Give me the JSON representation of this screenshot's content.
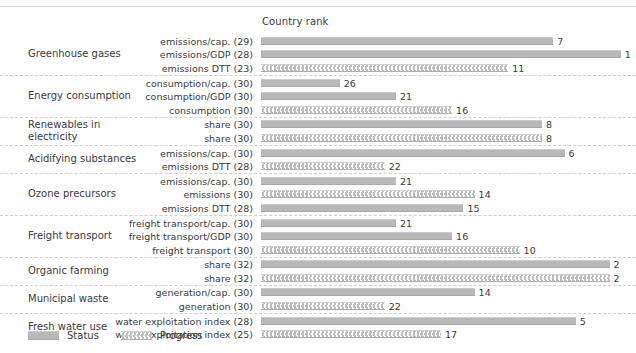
{
  "header": {
    "axis_title": "Country rank"
  },
  "legend": {
    "position": "bottom-left",
    "items": [
      {
        "key": "status",
        "label": "Status",
        "swatch": "solid-gray-bar"
      },
      {
        "key": "progress",
        "label": "Progress",
        "swatch": "chevron-pattern-bar"
      }
    ]
  },
  "chart_data": {
    "type": "bar",
    "title": "Country rank",
    "xlabel": "Country rank",
    "ylabel": "",
    "orientation": "horizontal",
    "xlim": [
      33,
      0
    ],
    "grid": false,
    "note": "Bar length is inversely proportional to rank: rank 1 is longest, rank 32 is shortest.",
    "series": [
      {
        "name": "Status",
        "pattern": "solid",
        "color": "#b9b9b9"
      },
      {
        "name": "Progress",
        "pattern": "chevron",
        "color": "#bdbdbd"
      }
    ],
    "groups": [
      {
        "group": "Greenhouse gases",
        "rows": [
          {
            "indicator": "emissions/cap. (29)",
            "series": "Status",
            "value": 7,
            "n": 29
          },
          {
            "indicator": "emissions/GDP (28)",
            "series": "Status",
            "value": 1,
            "n": 28
          },
          {
            "indicator": "emissions DTT (23)",
            "series": "Progress",
            "value": 11,
            "n": 23
          }
        ]
      },
      {
        "group": "Energy consumption",
        "rows": [
          {
            "indicator": "consumption/cap. (30)",
            "series": "Status",
            "value": 26,
            "n": 30
          },
          {
            "indicator": "consumption/GDP (30)",
            "series": "Status",
            "value": 21,
            "n": 30
          },
          {
            "indicator": "consumption (30)",
            "series": "Progress",
            "value": 16,
            "n": 30
          }
        ]
      },
      {
        "group": "Renewables in electricity",
        "rows": [
          {
            "indicator": "share (30)",
            "series": "Status",
            "value": 8,
            "n": 30
          },
          {
            "indicator": "share (30)",
            "series": "Progress",
            "value": 8,
            "n": 30
          }
        ]
      },
      {
        "group": "Acidifying substances",
        "rows": [
          {
            "indicator": "emissions/cap. (30)",
            "series": "Status",
            "value": 6,
            "n": 30
          },
          {
            "indicator": "emissions DTT (28)",
            "series": "Progress",
            "value": 22,
            "n": 28
          }
        ]
      },
      {
        "group": "Ozone precursors",
        "rows": [
          {
            "indicator": "emissions/cap. (30)",
            "series": "Status",
            "value": 21,
            "n": 30
          },
          {
            "indicator": "emissions (30)",
            "series": "Progress",
            "value": 14,
            "n": 30
          },
          {
            "indicator": "emissions DTT (28)",
            "series": "Status",
            "value": 15,
            "n": 28
          }
        ]
      },
      {
        "group": "Freight transport",
        "rows": [
          {
            "indicator": "freight transport/cap. (30)",
            "series": "Status",
            "value": 21,
            "n": 30
          },
          {
            "indicator": "freight transport/GDP (30)",
            "series": "Status",
            "value": 16,
            "n": 30
          },
          {
            "indicator": "freight transport (30)",
            "series": "Progress",
            "value": 10,
            "n": 30
          }
        ]
      },
      {
        "group": "Organic farming",
        "rows": [
          {
            "indicator": "share (32)",
            "series": "Status",
            "value": 2,
            "n": 32
          },
          {
            "indicator": "share (32)",
            "series": "Progress",
            "value": 2,
            "n": 32
          }
        ]
      },
      {
        "group": "Municipal waste",
        "rows": [
          {
            "indicator": "generation/cap. (30)",
            "series": "Status",
            "value": 14,
            "n": 30
          },
          {
            "indicator": "generation (30)",
            "series": "Progress",
            "value": 22,
            "n": 30
          }
        ]
      },
      {
        "group": "Fresh water use",
        "rows": [
          {
            "indicator": "water exploitation index (28)",
            "series": "Status",
            "value": 5,
            "n": 28
          },
          {
            "indicator": "water exploitation index (25)",
            "series": "Progress",
            "value": 17,
            "n": 25
          }
        ]
      }
    ]
  }
}
